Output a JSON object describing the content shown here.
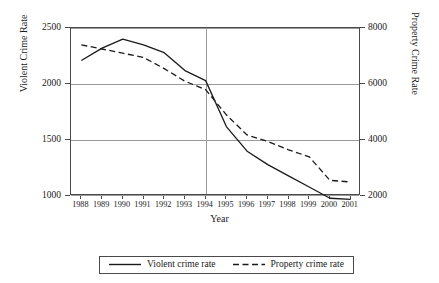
{
  "chart_data": {
    "type": "line",
    "title": "",
    "xlabel": "Year",
    "ylabel": "Violent Crime Rate",
    "y2label": "Property Crime Rate",
    "categories": [
      "1988",
      "1989",
      "1990",
      "1991",
      "1992",
      "1993",
      "1994",
      "1995",
      "1996",
      "1997",
      "1998",
      "1999",
      "2000",
      "2001"
    ],
    "ylim": [
      1000,
      2500
    ],
    "y2lim": [
      2000,
      8000
    ],
    "yticks": [
      "1000",
      "1500",
      "2000",
      "2500"
    ],
    "y2ticks": [
      "2000",
      "4000",
      "6000",
      "8000"
    ],
    "grid": "horizontal gridlines at each left tick; one vertical gridline at 1994",
    "legend_position": "below plot, centered, boxed",
    "series": [
      {
        "name": "Violent crime rate",
        "axis": "left",
        "style": "solid",
        "color": "#1a1a1a",
        "values": [
          2210,
          2320,
          2400,
          2350,
          2280,
          2120,
          2030,
          1620,
          1400,
          1280,
          1180,
          1080,
          980,
          970
        ]
      },
      {
        "name": "Property crime rate",
        "axis": "right",
        "style": "dashed",
        "color": "#1a1a1a",
        "values": [
          7400,
          7250,
          7100,
          6950,
          6550,
          6100,
          5800,
          4900,
          4180,
          3950,
          3650,
          3400,
          2560,
          2500
        ]
      }
    ]
  },
  "legend": {
    "items": [
      {
        "label": "Violent crime rate",
        "style": "solid"
      },
      {
        "label": "Property crime rate",
        "style": "dashed"
      }
    ]
  }
}
